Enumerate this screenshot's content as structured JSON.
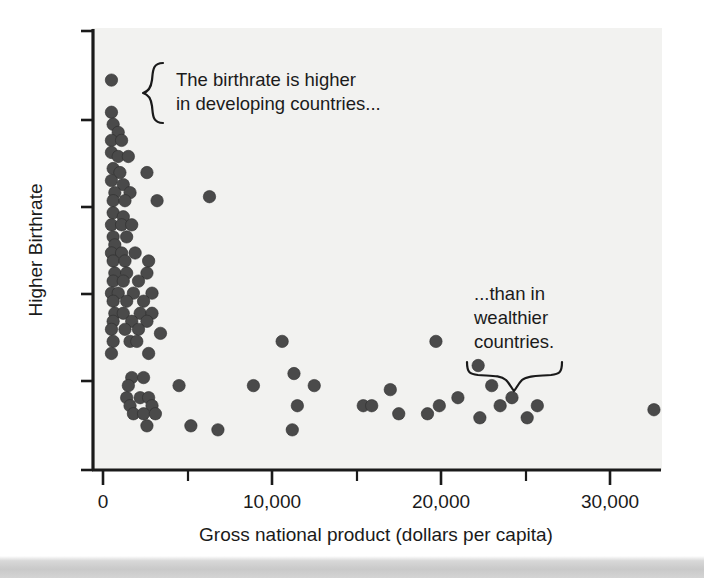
{
  "chart_data": {
    "type": "scatter",
    "title": "",
    "xlabel": "Gross national product (dollars per capita)",
    "ylabel": "Higher Birthrate",
    "xlim": [
      0,
      33000
    ],
    "ylim": [
      0,
      100
    ],
    "grid": false,
    "legend": null,
    "xticks": [
      0,
      5000,
      10000,
      15000,
      20000,
      25000,
      30000
    ],
    "xtick_labels": [
      "0",
      "",
      "10,000",
      "",
      "20,000",
      "",
      "30,000"
    ],
    "ytick_labels": [
      "",
      "",
      "",
      "",
      ""
    ],
    "yticks_unlabeled": true,
    "marker": "filled-circle",
    "marker_color": "#4a4a4a",
    "points": [
      [
        500,
        95
      ],
      [
        500,
        87
      ],
      [
        600,
        84
      ],
      [
        900,
        82
      ],
      [
        500,
        80
      ],
      [
        1100,
        80
      ],
      [
        500,
        77
      ],
      [
        900,
        76
      ],
      [
        1500,
        76
      ],
      [
        600,
        73
      ],
      [
        1000,
        72
      ],
      [
        2600,
        72
      ],
      [
        500,
        70
      ],
      [
        1200,
        69
      ],
      [
        700,
        67
      ],
      [
        1600,
        67
      ],
      [
        600,
        65
      ],
      [
        1300,
        65
      ],
      [
        3200,
        65
      ],
      [
        6300,
        66
      ],
      [
        600,
        62
      ],
      [
        1200,
        61
      ],
      [
        500,
        59
      ],
      [
        1100,
        59
      ],
      [
        1700,
        59
      ],
      [
        600,
        56
      ],
      [
        1400,
        56
      ],
      [
        700,
        54
      ],
      [
        500,
        52
      ],
      [
        1100,
        52
      ],
      [
        1900,
        52
      ],
      [
        600,
        50
      ],
      [
        1300,
        50
      ],
      [
        2700,
        50
      ],
      [
        700,
        47
      ],
      [
        1400,
        47
      ],
      [
        2600,
        47
      ],
      [
        600,
        45
      ],
      [
        1200,
        45
      ],
      [
        2100,
        45
      ],
      [
        500,
        42
      ],
      [
        900,
        42
      ],
      [
        1800,
        42
      ],
      [
        2900,
        42
      ],
      [
        600,
        40
      ],
      [
        1400,
        40
      ],
      [
        2400,
        40
      ],
      [
        700,
        37
      ],
      [
        1200,
        37
      ],
      [
        2200,
        37
      ],
      [
        2900,
        37
      ],
      [
        600,
        35
      ],
      [
        1700,
        35
      ],
      [
        2600,
        35
      ],
      [
        500,
        33
      ],
      [
        1300,
        33
      ],
      [
        2100,
        33
      ],
      [
        3400,
        32
      ],
      [
        600,
        30
      ],
      [
        1600,
        30
      ],
      [
        2000,
        30
      ],
      [
        10600,
        30
      ],
      [
        19700,
        30
      ],
      [
        500,
        27
      ],
      [
        2700,
        27
      ],
      [
        22200,
        24
      ],
      [
        1700,
        21
      ],
      [
        2400,
        21
      ],
      [
        11300,
        22
      ],
      [
        1500,
        19
      ],
      [
        4500,
        19
      ],
      [
        8900,
        19
      ],
      [
        12500,
        19
      ],
      [
        23000,
        19
      ],
      [
        17000,
        18
      ],
      [
        1400,
        16
      ],
      [
        2200,
        16
      ],
      [
        2700,
        16
      ],
      [
        21000,
        16
      ],
      [
        24200,
        16
      ],
      [
        1600,
        14
      ],
      [
        2900,
        14
      ],
      [
        11500,
        14
      ],
      [
        15400,
        14
      ],
      [
        15900,
        14
      ],
      [
        19900,
        14
      ],
      [
        23500,
        14
      ],
      [
        25700,
        14
      ],
      [
        32600,
        13
      ],
      [
        1800,
        12
      ],
      [
        2400,
        12
      ],
      [
        3100,
        12
      ],
      [
        17500,
        12
      ],
      [
        19200,
        12
      ],
      [
        22300,
        11
      ],
      [
        25100,
        11
      ],
      [
        2600,
        9
      ],
      [
        5200,
        9
      ],
      [
        6800,
        8
      ],
      [
        11200,
        8
      ]
    ],
    "annotations": [
      {
        "id": "developing-countries-note",
        "text_lines": [
          "The birthrate is higher",
          "in developing countries..."
        ],
        "brace_orientation": "left-vertical",
        "points_to": "upper-left cluster"
      },
      {
        "id": "wealthier-countries-note",
        "text_lines": [
          "...than in",
          "wealthier",
          "countries."
        ],
        "brace_orientation": "bottom-horizontal",
        "points_to": "lower-right cluster"
      }
    ]
  },
  "axes": {
    "x_title": "Gross national product (dollars per capita)",
    "y_title": "Higher Birthrate",
    "x_labels": [
      {
        "value": "0",
        "x": 103
      },
      {
        "value": "10,000",
        "x": 272
      },
      {
        "value": "20,000",
        "x": 441
      },
      {
        "value": "30,000",
        "x": 610
      }
    ]
  },
  "annotations": {
    "left": {
      "line1": "The birthrate is higher",
      "line2": "in developing countries..."
    },
    "right": {
      "line1": "...than in",
      "line2": "wealthier",
      "line3": "countries."
    }
  },
  "colors": {
    "plot_background": "#f2f2f0",
    "page_background": "#ffffff",
    "marker": "#4a4a4a",
    "axis": "#1a1a1a",
    "text": "#1a1a1a"
  }
}
